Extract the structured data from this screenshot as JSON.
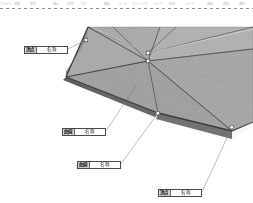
{
  "app": {
    "type": "3d-modeling-viewport",
    "background_color": "#ffffff"
  },
  "menubar": {
    "items": [
      {
        "label": "ファイル"
      },
      {
        "label": "編集"
      },
      {
        "label": "表示"
      },
      {
        "label": "挿入"
      },
      {
        "label": "形状"
      },
      {
        "label": "寸法"
      },
      {
        "label": "解析"
      },
      {
        "label": "ツール"
      },
      {
        "label": "ウィンドウ"
      },
      {
        "label": "ヘルプ"
      },
      {
        "label": "設定"
      },
      {
        "label": "レイヤ"
      },
      {
        "label": "描画"
      },
      {
        "label": "選択"
      },
      {
        "label": "属性"
      },
      {
        "label": "出力"
      }
    ]
  },
  "model": {
    "surface_color": "#a8a8a8",
    "surface_color_dark": "#8f8f8f",
    "surface_color_light": "#b6b6b6",
    "edge_color": "#3a3a3a",
    "vertex_marker_color": "#ffffff",
    "vertex_marker_border": "#2f2f2f",
    "vertex_count": 5,
    "description": "faceted triangulated polygon surface"
  },
  "callouts": [
    {
      "id": "callout-1",
      "key": "頂点",
      "value": "名称",
      "anchor_x": 86,
      "anchor_y": 31
    },
    {
      "id": "callout-2",
      "key": "曲線",
      "value": "名称",
      "anchor_x": 137,
      "anchor_y": 75
    },
    {
      "id": "callout-3",
      "key": "曲線",
      "value": "名称",
      "anchor_x": 158,
      "anchor_y": 104
    },
    {
      "id": "callout-4",
      "key": "頂点",
      "value": "名称",
      "anchor_x": 232,
      "anchor_y": 118
    }
  ]
}
